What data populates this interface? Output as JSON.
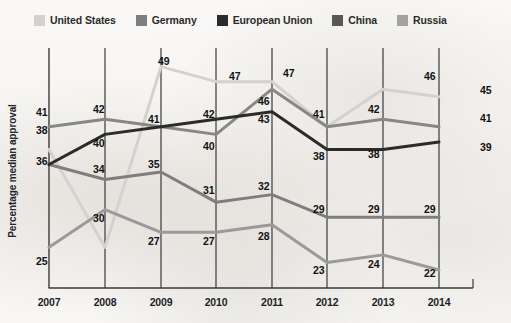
{
  "legend": {
    "position": "top-left",
    "items": [
      {
        "label": "United States",
        "color": "#d3d2d0",
        "swatch_name": "legend-swatch-united-states"
      },
      {
        "label": "Germany",
        "color": "#7e7e7e",
        "swatch_name": "legend-swatch-germany"
      },
      {
        "label": "European Union",
        "color": "#2b2b2b",
        "swatch_name": "legend-swatch-european-union"
      },
      {
        "label": "China",
        "color": "#585858",
        "swatch_name": "legend-swatch-china"
      },
      {
        "label": "Russia",
        "color": "#a2a2a2",
        "swatch_name": "legend-swatch-russia"
      }
    ]
  },
  "chart_data": {
    "type": "line",
    "title": "",
    "xlabel": "",
    "ylabel": "Percentage median approval",
    "categories": [
      "2007",
      "2008",
      "2009",
      "2010",
      "2011",
      "2012",
      "2013",
      "2014"
    ],
    "ylim": [
      20,
      52
    ],
    "grid": "vertical",
    "series": [
      {
        "name": "United States",
        "color": "#d3d2d0",
        "values": [
          38,
          25,
          49,
          47,
          47,
          41,
          46,
          45
        ]
      },
      {
        "name": "Germany",
        "color": "#7e7e7e",
        "values": [
          36,
          34,
          35,
          31,
          32,
          29,
          29,
          29
        ]
      },
      {
        "name": "European Union",
        "color": "#2b2b2b",
        "values": [
          36,
          40,
          41,
          42,
          43,
          38,
          38,
          39
        ]
      },
      {
        "name": "China",
        "color": "#9a9a9a",
        "values": [
          25,
          30,
          27,
          27,
          28,
          23,
          24,
          22
        ]
      },
      {
        "name": "Russia",
        "color": "#878787",
        "values": [
          41,
          42,
          41,
          40,
          46,
          41,
          42,
          41
        ]
      }
    ],
    "point_labels": [
      {
        "text": "41",
        "x": 36,
        "y": 106
      },
      {
        "text": "38",
        "x": 36,
        "y": 124
      },
      {
        "text": "36",
        "x": 36,
        "y": 155
      },
      {
        "text": "25",
        "x": 36,
        "y": 255
      },
      {
        "text": "42",
        "x": 93,
        "y": 103
      },
      {
        "text": "40",
        "x": 93,
        "y": 137
      },
      {
        "text": "34",
        "x": 93,
        "y": 163
      },
      {
        "text": "30",
        "x": 93,
        "y": 212
      },
      {
        "text": "49",
        "x": 158,
        "y": 55
      },
      {
        "text": "41",
        "x": 148,
        "y": 113
      },
      {
        "text": "35",
        "x": 148,
        "y": 158
      },
      {
        "text": "27",
        "x": 148,
        "y": 235
      },
      {
        "text": "47",
        "x": 229,
        "y": 70
      },
      {
        "text": "42",
        "x": 203,
        "y": 108
      },
      {
        "text": "40",
        "x": 203,
        "y": 140
      },
      {
        "text": "31",
        "x": 203,
        "y": 184
      },
      {
        "text": "27",
        "x": 203,
        "y": 235
      },
      {
        "text": "47",
        "x": 283,
        "y": 67
      },
      {
        "text": "46",
        "x": 258,
        "y": 95
      },
      {
        "text": "43",
        "x": 258,
        "y": 113
      },
      {
        "text": "32",
        "x": 258,
        "y": 180
      },
      {
        "text": "28",
        "x": 258,
        "y": 230
      },
      {
        "text": "41",
        "x": 313,
        "y": 108
      },
      {
        "text": "38",
        "x": 313,
        "y": 150
      },
      {
        "text": "29",
        "x": 313,
        "y": 203
      },
      {
        "text": "23",
        "x": 313,
        "y": 264
      },
      {
        "text": "46",
        "x": 424,
        "y": 70
      },
      {
        "text": "42",
        "x": 368,
        "y": 103
      },
      {
        "text": "38",
        "x": 368,
        "y": 148
      },
      {
        "text": "29",
        "x": 368,
        "y": 203
      },
      {
        "text": "24",
        "x": 368,
        "y": 258
      },
      {
        "text": "45",
        "x": 480,
        "y": 84
      },
      {
        "text": "41",
        "x": 480,
        "y": 112
      },
      {
        "text": "39",
        "x": 480,
        "y": 141
      },
      {
        "text": "29",
        "x": 424,
        "y": 203
      },
      {
        "text": "22",
        "x": 424,
        "y": 267
      }
    ],
    "axis": {
      "x_positions": [
        49,
        105,
        161,
        216,
        272,
        327,
        383,
        439
      ],
      "baseline_y": 288,
      "top_y": 48,
      "value_to_y": {
        "v_min": 20,
        "y_min": 285,
        "v_max": 52,
        "y_max": 44
      }
    }
  }
}
